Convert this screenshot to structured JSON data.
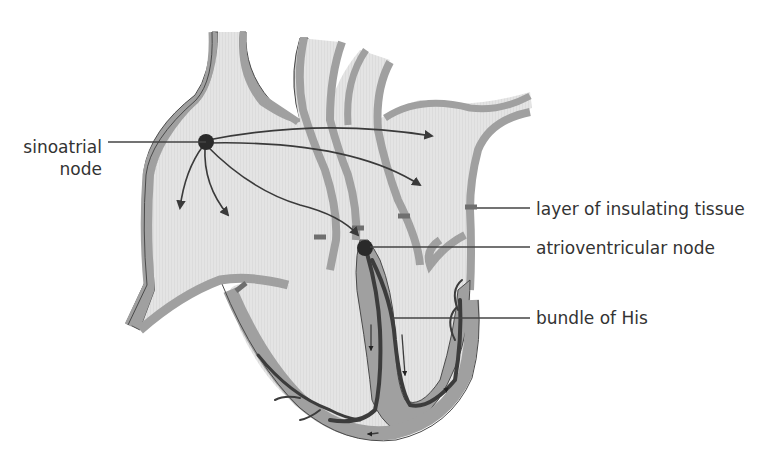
{
  "diagram": {
    "labels": {
      "sinoatrial_line1": "sinoatrial",
      "sinoatrial_line2": "node",
      "layer": "layer of insulating tissue",
      "av_node": "atrioventricular node",
      "bundle": "bundle of His"
    },
    "colors": {
      "wall": "#a0a0a0",
      "chamber": "#e2e2e2",
      "outline": "#4a4a4a",
      "node": "#2a2a2a",
      "fibre": "#3c3c3c",
      "insulation": "#6f6f6f",
      "label_line": "#444444"
    }
  }
}
